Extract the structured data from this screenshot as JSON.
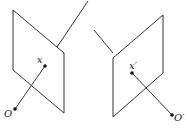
{
  "diagram": {
    "type": "epipolar-geometry",
    "left_camera": {
      "center_label": "O",
      "point_label": "x"
    },
    "right_camera": {
      "center_label": "O′",
      "point_label": "x′"
    },
    "colors": {
      "stroke": "#333333",
      "background": "#ffffff"
    }
  }
}
